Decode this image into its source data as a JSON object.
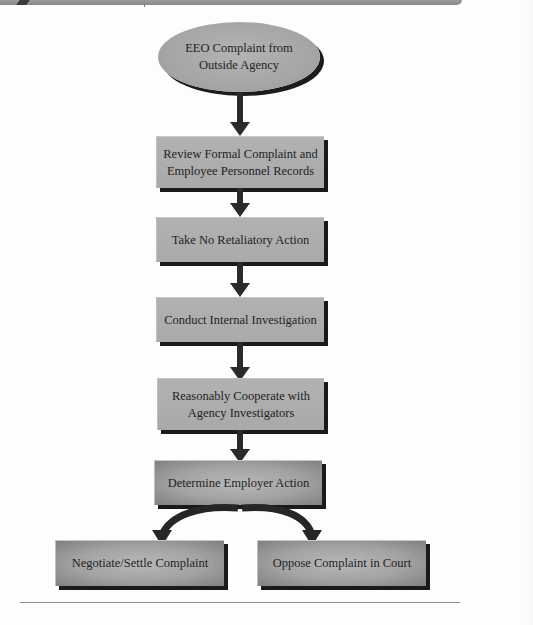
{
  "diagram": {
    "type": "flowchart",
    "start": {
      "label": "EEO Complaint from Outside Agency",
      "lines": [
        "EEO Complaint from",
        "Outside Agency"
      ]
    },
    "steps": [
      {
        "id": "review",
        "lines": [
          "Review Formal Complaint and",
          "Employee Personnel Records"
        ]
      },
      {
        "id": "no-retaliation",
        "lines": [
          "Take No Retaliatory Action"
        ]
      },
      {
        "id": "investigate",
        "lines": [
          "Conduct Internal Investigation"
        ]
      },
      {
        "id": "cooperate",
        "lines": [
          "Reasonably Cooperate with",
          "Agency Investigators"
        ]
      },
      {
        "id": "determine",
        "lines": [
          "Determine Employer Action"
        ]
      }
    ],
    "outcomes": [
      {
        "id": "negotiate",
        "label": "Negotiate/Settle Complaint"
      },
      {
        "id": "oppose",
        "label": "Oppose Complaint in Court"
      }
    ],
    "colors": {
      "box_fill": "#acacac",
      "box_shadow": "#1a1a1a",
      "arrow": "#2a2a2a",
      "text": "#232323"
    }
  }
}
